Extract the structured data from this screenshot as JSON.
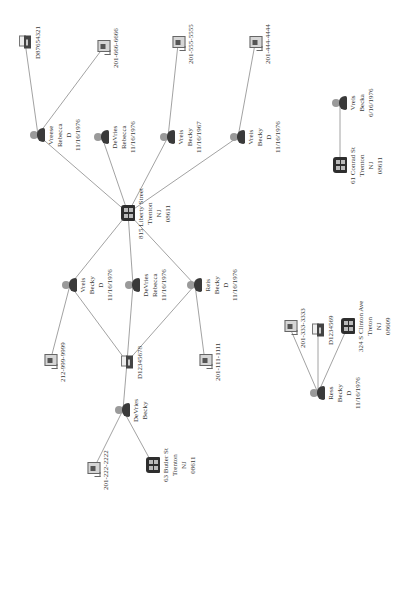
{
  "diagram": {
    "orientation": "rotated-90-ccw",
    "edge_color": "#8a8a8a",
    "icon_types": {
      "person": "person-icon",
      "address": "building-icon",
      "phone": "telephone-icon",
      "document": "fax-document-icon"
    },
    "nodes": [
      {
        "id": "addr_liberty",
        "type": "address",
        "x": 128,
        "y": 213,
        "lines": [
          "815 Liberty Street",
          "Trenton",
          "NJ",
          "08611"
        ]
      },
      {
        "id": "p_vreese_rebecca",
        "type": "person",
        "x": 38,
        "y": 135,
        "lines": [
          "Vreese",
          "Rebecca",
          "D",
          "11/16/1976"
        ]
      },
      {
        "id": "doc_d87654321",
        "type": "document",
        "x": 25,
        "y": 42,
        "lines": [
          "D87654321"
        ]
      },
      {
        "id": "ph_6666",
        "type": "phone",
        "x": 103,
        "y": 48,
        "lines": [
          "201-666-6666"
        ]
      },
      {
        "id": "p_devries_rebecca_top",
        "type": "person",
        "x": 102,
        "y": 137,
        "lines": [
          "DeVries",
          "Rebecca",
          "11/16/1976"
        ]
      },
      {
        "id": "p_vreis_becky_1967",
        "type": "person",
        "x": 168,
        "y": 137,
        "lines": [
          "Vreis",
          "Becky",
          "11/16/1967"
        ]
      },
      {
        "id": "ph_5555",
        "type": "phone",
        "x": 178,
        "y": 44,
        "lines": [
          "201-555-5555"
        ]
      },
      {
        "id": "p_vreis_becky_top",
        "type": "person",
        "x": 238,
        "y": 137,
        "lines": [
          "Vreis",
          "Becky",
          "D",
          "11/16/1976"
        ]
      },
      {
        "id": "ph_4444",
        "type": "phone",
        "x": 255,
        "y": 44,
        "lines": [
          "201-444-4444"
        ]
      },
      {
        "id": "p_vreis_becky_left",
        "type": "person",
        "x": 70,
        "y": 285,
        "lines": [
          "Vreis",
          "Becky",
          "D",
          "11/16/1976"
        ]
      },
      {
        "id": "p_devries_rebecca_mid",
        "type": "person",
        "x": 133,
        "y": 285,
        "lines": [
          "DeVries",
          "Rebecca",
          "11/16/1976"
        ]
      },
      {
        "id": "p_reis_becky",
        "type": "person",
        "x": 195,
        "y": 285,
        "lines": [
          "Reis",
          "Becky",
          "D",
          "11/16/1976"
        ]
      },
      {
        "id": "ph_9999",
        "type": "phone",
        "x": 50,
        "y": 362,
        "lines": [
          "212-999-9999"
        ]
      },
      {
        "id": "doc_d12345678",
        "type": "document",
        "x": 127,
        "y": 362,
        "lines": [
          "D12345678"
        ]
      },
      {
        "id": "ph_1111",
        "type": "phone",
        "x": 205,
        "y": 362,
        "lines": [
          "201-111-1111"
        ]
      },
      {
        "id": "p_devries_becky",
        "type": "person",
        "x": 123,
        "y": 410,
        "lines": [
          "DeVries",
          "Becky"
        ]
      },
      {
        "id": "ph_2222",
        "type": "phone",
        "x": 93,
        "y": 470,
        "lines": [
          "201-222-2222"
        ]
      },
      {
        "id": "addr_butler",
        "type": "address",
        "x": 153,
        "y": 465,
        "lines": [
          "63 Butler St",
          "Trenton",
          "NJ",
          "08611"
        ]
      },
      {
        "id": "p_ress_becky",
        "type": "person",
        "x": 318,
        "y": 393,
        "lines": [
          "Ress",
          "Becky",
          "D",
          "11/16/1976"
        ]
      },
      {
        "id": "ph_3333",
        "type": "phone",
        "x": 290,
        "y": 328,
        "lines": [
          "201-333-3333"
        ]
      },
      {
        "id": "doc_d1234569",
        "type": "document",
        "x": 318,
        "y": 330,
        "lines": [
          "D1234569"
        ]
      },
      {
        "id": "addr_clinton",
        "type": "address",
        "x": 348,
        "y": 326,
        "lines": [
          "324 S Clinton Ave",
          "Treton",
          "NJ",
          "08609"
        ]
      },
      {
        "id": "p_vreis_becka",
        "type": "person",
        "x": 340,
        "y": 103,
        "lines": [
          "Vreis",
          "Becka",
          "6/16/1976"
        ]
      },
      {
        "id": "addr_conrad",
        "type": "address",
        "x": 340,
        "y": 165,
        "lines": [
          "61 Conrad St",
          "Trenton",
          "NJ",
          "08611"
        ]
      }
    ],
    "edges": [
      [
        "addr_liberty",
        "p_vreese_rebecca"
      ],
      [
        "p_vreese_rebecca",
        "doc_d87654321"
      ],
      [
        "p_vreese_rebecca",
        "ph_6666"
      ],
      [
        "addr_liberty",
        "p_devries_rebecca_top"
      ],
      [
        "addr_liberty",
        "p_vreis_becky_1967"
      ],
      [
        "p_vreis_becky_1967",
        "ph_5555"
      ],
      [
        "addr_liberty",
        "p_vreis_becky_top"
      ],
      [
        "p_vreis_becky_top",
        "ph_4444"
      ],
      [
        "addr_liberty",
        "p_vreis_becky_left"
      ],
      [
        "addr_liberty",
        "p_devries_rebecca_mid"
      ],
      [
        "addr_liberty",
        "p_reis_becky"
      ],
      [
        "p_vreis_becky_left",
        "ph_9999"
      ],
      [
        "p_vreis_becky_left",
        "doc_d12345678"
      ],
      [
        "p_devries_rebecca_mid",
        "doc_d12345678"
      ],
      [
        "p_reis_becky",
        "doc_d12345678"
      ],
      [
        "p_reis_becky",
        "ph_1111"
      ],
      [
        "doc_d12345678",
        "p_devries_becky"
      ],
      [
        "p_devries_becky",
        "ph_2222"
      ],
      [
        "p_devries_becky",
        "addr_butler"
      ],
      [
        "p_ress_becky",
        "ph_3333"
      ],
      [
        "p_ress_becky",
        "doc_d1234569"
      ],
      [
        "p_ress_becky",
        "addr_clinton"
      ],
      [
        "p_vreis_becka",
        "addr_conrad"
      ]
    ]
  }
}
